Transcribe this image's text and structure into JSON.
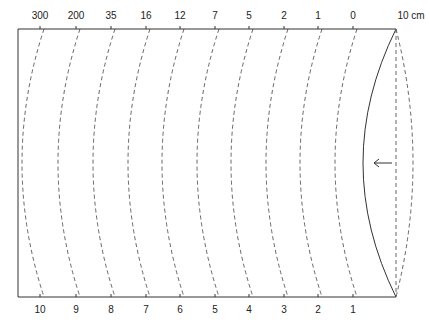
{
  "diagram": {
    "top_labels": [
      "300",
      "200",
      "35",
      "16",
      "12",
      "7",
      "5",
      "2",
      "1",
      "0"
    ],
    "bottom_labels": [
      "10",
      "9",
      "8",
      "7",
      "6",
      "5",
      "4",
      "3",
      "2",
      "1"
    ],
    "end_label": "10 cm",
    "arrow": "left-arrow",
    "colors": {
      "line": "#333333",
      "dash": "#555555",
      "background": "#ffffff"
    }
  }
}
